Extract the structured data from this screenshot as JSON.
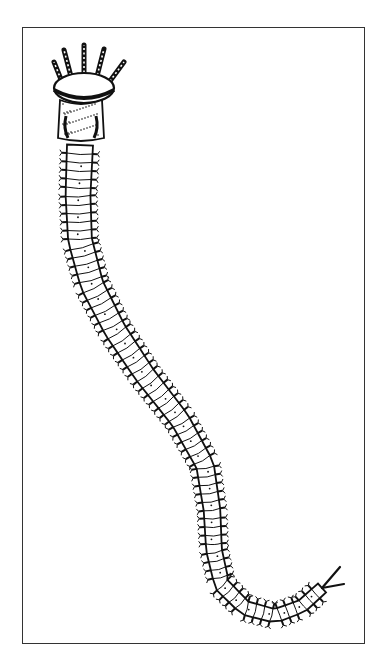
{
  "figure": {
    "colors": {
      "ink": "#111111",
      "background": "#ffffff",
      "frame": "#333333"
    },
    "frame": {
      "x": 22,
      "y": 27,
      "width": 343,
      "height": 617
    },
    "head": {
      "tentacle_tips": [
        [
          54,
          62
        ],
        [
          64,
          50
        ],
        [
          84,
          45
        ],
        [
          104,
          49
        ],
        [
          124,
          62
        ]
      ],
      "crown": {
        "cx": 84,
        "cy": 88,
        "rx": 30,
        "ry": 15
      },
      "prostomium": {
        "x": 60,
        "y": 100,
        "width": 42,
        "height": 38
      }
    },
    "body": {
      "path": [
        [
          80,
          145
        ],
        [
          78,
          195
        ],
        [
          80,
          240
        ],
        [
          92,
          285
        ],
        [
          115,
          330
        ],
        [
          145,
          375
        ],
        [
          180,
          420
        ],
        [
          205,
          465
        ],
        [
          212,
          510
        ],
        [
          214,
          550
        ],
        [
          222,
          585
        ],
        [
          245,
          608
        ],
        [
          275,
          616
        ],
        [
          302,
          606
        ],
        [
          322,
          588
        ]
      ],
      "segment_count": 70,
      "start_width": 26,
      "end_width": 12
    },
    "tail": {
      "cirri": [
        [
          322,
          588
        ],
        [
          340,
          567
        ],
        [
          322,
          588
        ],
        [
          344,
          584
        ]
      ]
    }
  }
}
